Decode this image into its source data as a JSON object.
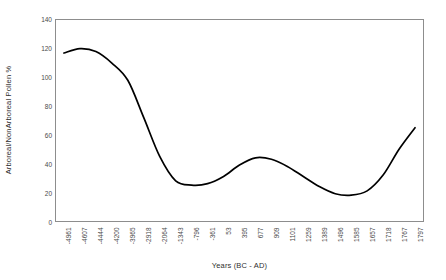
{
  "chart_data": {
    "type": "line",
    "title": "",
    "xlabel": "Years (BC - AD)",
    "ylabel": "Arboreal/NonArboreal Pollen %",
    "ylim": [
      0,
      140
    ],
    "yticks": [
      0,
      20,
      40,
      60,
      80,
      100,
      120,
      140
    ],
    "ytick_labels": [
      "0",
      "20",
      "40",
      "60",
      "80",
      "100",
      "120",
      "140"
    ],
    "grid": false,
    "legend": false,
    "legend_position": "none",
    "line_color": "#000000",
    "line_width": 1.7,
    "markers": false,
    "categories": [
      "-4961",
      "-4607",
      "-4444",
      "-4200",
      "-3965",
      "-2918",
      "-2064",
      "-1343",
      "-796",
      "-361",
      "53",
      "395",
      "677",
      "909",
      "1101",
      "1259",
      "1389",
      "1496",
      "1585",
      "1657",
      "1718",
      "1767",
      "1797"
    ],
    "values": [
      117,
      120,
      118,
      110,
      98,
      72,
      45,
      28,
      25,
      26,
      31,
      39,
      44,
      43,
      38,
      31,
      24,
      19,
      18,
      21,
      32,
      50,
      65
    ],
    "series": [
      {
        "name": "Arboreal/NonArboreal Pollen %",
        "values": [
          117,
          120,
          118,
          110,
          98,
          72,
          45,
          28,
          25,
          26,
          31,
          39,
          44,
          43,
          38,
          31,
          24,
          19,
          18,
          21,
          32,
          50,
          65
        ]
      }
    ],
    "annotations": []
  },
  "figure": {
    "background_color": "#ffffff",
    "frame_color": "#8d8d8d",
    "text_color": "#4a4a4a"
  }
}
